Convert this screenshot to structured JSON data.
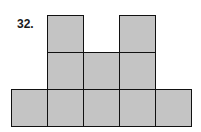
{
  "problem": {
    "number": "32."
  },
  "figure": {
    "fill_color": "#c4c4c4",
    "stroke_color": "#111111",
    "rows": [
      {
        "row": 1,
        "columns_filled": [
          2,
          4
        ]
      },
      {
        "row": 2,
        "columns_filled": [
          2,
          3,
          4
        ]
      },
      {
        "row": 3,
        "columns_filled": [
          1,
          2,
          3,
          4,
          5
        ]
      }
    ],
    "total_squares": 10
  }
}
